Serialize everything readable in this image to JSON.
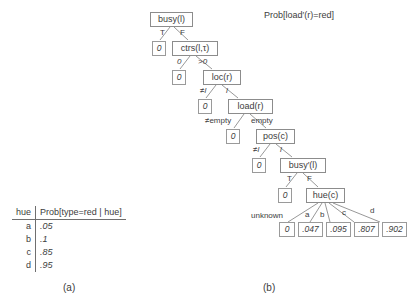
{
  "figure": {
    "panel_b_title": "Prob[load′(r)=red]",
    "caption_a": "(a)",
    "caption_b": "(b)"
  },
  "table": {
    "headers": [
      "hue",
      "Prob[type=red | hue]"
    ],
    "rows": [
      {
        "hue": "a",
        "prob": ".05"
      },
      {
        "hue": "b",
        "prob": ".1"
      },
      {
        "hue": "c",
        "prob": ".85"
      },
      {
        "hue": "d",
        "prob": ".95"
      }
    ]
  },
  "tree": {
    "nodes": [
      {
        "id": "busy",
        "label": "busy(l)"
      },
      {
        "id": "ctrs",
        "label": "ctrs(l,τ)"
      },
      {
        "id": "loc",
        "label": "loc(r)"
      },
      {
        "id": "load",
        "label": "load(r)"
      },
      {
        "id": "pos",
        "label": "pos(c)"
      },
      {
        "id": "busyp",
        "label": "busy′(l)"
      },
      {
        "id": "hue",
        "label": "hue(c)"
      }
    ],
    "leaves": [
      {
        "id": "leaf-busy-true",
        "value": "0"
      },
      {
        "id": "leaf-ctrs-zero",
        "value": "0"
      },
      {
        "id": "leaf-loc-ne",
        "value": "0"
      },
      {
        "id": "leaf-load-ne",
        "value": "0"
      },
      {
        "id": "leaf-pos-ne",
        "value": "0"
      },
      {
        "id": "leaf-busyp-true",
        "value": "0"
      },
      {
        "id": "leaf-hue-unknown",
        "value": "0"
      },
      {
        "id": "leaf-hue-a",
        "value": ".047"
      },
      {
        "id": "leaf-hue-b",
        "value": ".095"
      },
      {
        "id": "leaf-hue-c",
        "value": ".807"
      },
      {
        "id": "leaf-hue-d",
        "value": ".902"
      }
    ],
    "edge_labels": [
      {
        "id": "busy-T",
        "text": "T"
      },
      {
        "id": "busy-F",
        "text": "F"
      },
      {
        "id": "ctrs-zero",
        "text": "0"
      },
      {
        "id": "ctrs-gtzero",
        "text": ">0"
      },
      {
        "id": "loc-ne",
        "text": "≠l"
      },
      {
        "id": "loc-eq",
        "text": "l"
      },
      {
        "id": "load-nonempty",
        "text": "≠empty"
      },
      {
        "id": "load-empty",
        "text": "empty"
      },
      {
        "id": "pos-ne",
        "text": "≠l"
      },
      {
        "id": "pos-eq",
        "text": "l"
      },
      {
        "id": "busyp-T",
        "text": "T"
      },
      {
        "id": "busyp-F",
        "text": "F"
      },
      {
        "id": "hue-unknown",
        "text": "unknown"
      },
      {
        "id": "hue-a",
        "text": "a"
      },
      {
        "id": "hue-b",
        "text": "b"
      },
      {
        "id": "hue-c",
        "text": "c"
      },
      {
        "id": "hue-d",
        "text": "d"
      }
    ]
  },
  "colors": {
    "box_border": "#8c8c8c",
    "edge_stroke": "#8c8c8c",
    "text": "#3d3d3d",
    "background": "#ffffff"
  }
}
